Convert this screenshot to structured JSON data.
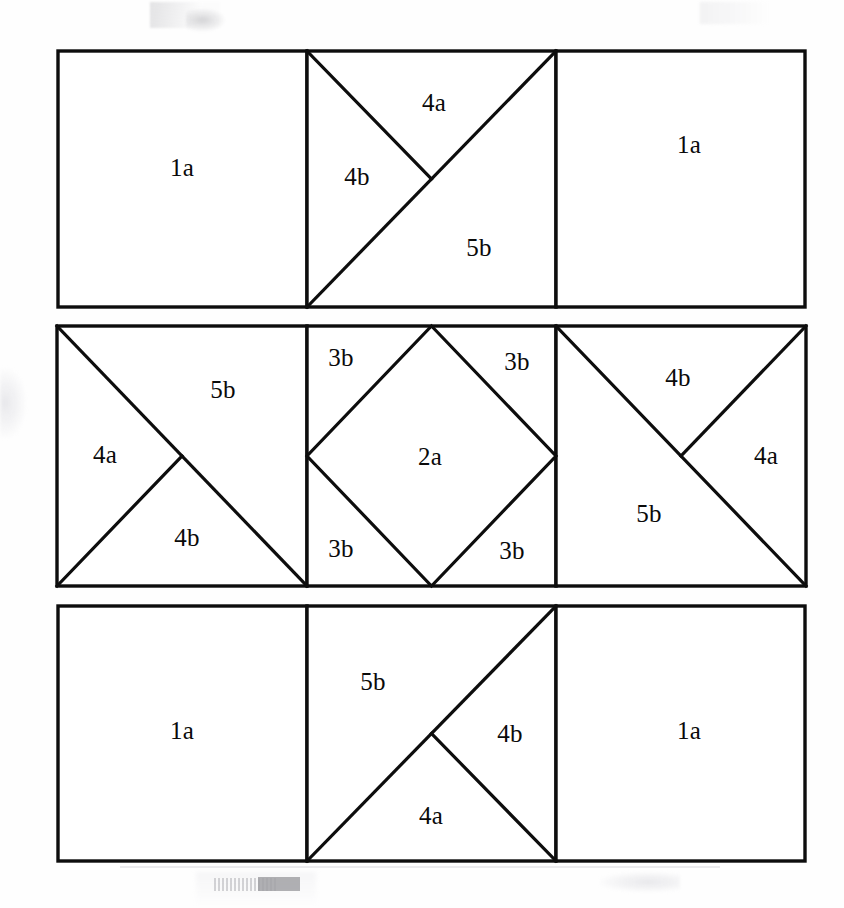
{
  "diagram": {
    "canvas": {
      "width": 844,
      "height": 908
    },
    "style": {
      "line_color": "#0d0d0d",
      "fill_color": "#ffffff",
      "background": "#fefefe",
      "outline_width": 3.4,
      "divider_width": 3.2
    },
    "rows": [
      {
        "name": "row-top",
        "bounds": {
          "x": 58,
          "y": 51,
          "width": 747,
          "height": 256
        },
        "dividers_x": [
          307,
          556
        ],
        "panels": [
          {
            "name": "panel-top-left",
            "bounds": {
              "x": 58,
              "y": 51,
              "width": 249,
              "height": 256
            },
            "pattern": "plain-square",
            "labels": [
              {
                "text": "1a",
                "x": 182,
                "y": 170
              }
            ],
            "cuts": []
          },
          {
            "name": "panel-top-center",
            "bounds": {
              "x": 307,
              "y": 51,
              "width": 249,
              "height": 256
            },
            "pattern": "diagonal-bl-tr-plus-tl-to-center",
            "labels": [
              {
                "text": "4a",
                "x": 434,
                "y": 105
              },
              {
                "text": "4b",
                "x": 357,
                "y": 179
              },
              {
                "text": "5b",
                "x": 479,
                "y": 250
              }
            ],
            "cuts": [
              {
                "from": "bottom-left",
                "to": "top-right"
              },
              {
                "from": "top-left",
                "to": "center"
              }
            ]
          },
          {
            "name": "panel-top-right",
            "bounds": {
              "x": 556,
              "y": 51,
              "width": 249,
              "height": 256
            },
            "pattern": "plain-square",
            "labels": [
              {
                "text": "1a",
                "x": 689,
                "y": 147
              }
            ],
            "cuts": []
          }
        ]
      },
      {
        "name": "row-middle",
        "bounds": {
          "x": 57,
          "y": 326,
          "width": 749,
          "height": 260
        },
        "dividers_x": [
          307,
          556
        ],
        "panels": [
          {
            "name": "panel-middle-left",
            "bounds": {
              "x": 57,
              "y": 326,
              "width": 250,
              "height": 260
            },
            "pattern": "diagonal-tl-br-plus-bl-to-center",
            "labels": [
              {
                "text": "5b",
                "x": 223,
                "y": 392
              },
              {
                "text": "4a",
                "x": 105,
                "y": 457
              },
              {
                "text": "4b",
                "x": 187,
                "y": 540
              }
            ],
            "cuts": [
              {
                "from": "top-left",
                "to": "bottom-right"
              },
              {
                "from": "bottom-left",
                "to": "center"
              }
            ]
          },
          {
            "name": "panel-middle-center",
            "bounds": {
              "x": 307,
              "y": 326,
              "width": 249,
              "height": 260
            },
            "pattern": "inscribed-diamond",
            "labels": [
              {
                "text": "3b",
                "x": 341,
                "y": 360
              },
              {
                "text": "3b",
                "x": 517,
                "y": 364
              },
              {
                "text": "2a",
                "x": 430,
                "y": 459
              },
              {
                "text": "3b",
                "x": 341,
                "y": 551
              },
              {
                "text": "3b",
                "x": 512,
                "y": 553
              }
            ],
            "cuts": [
              {
                "from": "midpoint-top",
                "to": "midpoint-right"
              },
              {
                "from": "midpoint-right",
                "to": "midpoint-bottom"
              },
              {
                "from": "midpoint-bottom",
                "to": "midpoint-left"
              },
              {
                "from": "midpoint-left",
                "to": "midpoint-top"
              }
            ]
          },
          {
            "name": "panel-middle-right",
            "bounds": {
              "x": 556,
              "y": 326,
              "width": 250,
              "height": 260
            },
            "pattern": "diagonal-tl-br-plus-tr-to-center",
            "labels": [
              {
                "text": "4b",
                "x": 678,
                "y": 380
              },
              {
                "text": "4a",
                "x": 766,
                "y": 458
              },
              {
                "text": "5b",
                "x": 649,
                "y": 516
              }
            ],
            "cuts": [
              {
                "from": "top-left",
                "to": "bottom-right"
              },
              {
                "from": "top-right",
                "to": "center"
              }
            ]
          }
        ]
      },
      {
        "name": "row-bottom",
        "bounds": {
          "x": 58,
          "y": 606,
          "width": 747,
          "height": 255
        },
        "dividers_x": [
          307,
          556
        ],
        "panels": [
          {
            "name": "panel-bottom-left",
            "bounds": {
              "x": 58,
              "y": 606,
              "width": 249,
              "height": 255
            },
            "pattern": "plain-square",
            "labels": [
              {
                "text": "1a",
                "x": 182,
                "y": 733
              }
            ],
            "cuts": []
          },
          {
            "name": "panel-bottom-center",
            "bounds": {
              "x": 307,
              "y": 606,
              "width": 249,
              "height": 255
            },
            "pattern": "diagonal-bl-tr-plus-br-to-center",
            "labels": [
              {
                "text": "5b",
                "x": 373,
                "y": 684
              },
              {
                "text": "4b",
                "x": 510,
                "y": 736
              },
              {
                "text": "4a",
                "x": 431,
                "y": 818
              }
            ],
            "cuts": [
              {
                "from": "bottom-left",
                "to": "top-right"
              },
              {
                "from": "bottom-right",
                "to": "center"
              }
            ]
          },
          {
            "name": "panel-bottom-right",
            "bounds": {
              "x": 556,
              "y": 606,
              "width": 249,
              "height": 255
            },
            "pattern": "plain-square",
            "labels": [
              {
                "text": "1a",
                "x": 689,
                "y": 733
              }
            ],
            "cuts": []
          }
        ]
      }
    ],
    "patch_codes": [
      "1a",
      "2a",
      "3b",
      "4a",
      "4b",
      "5b"
    ]
  }
}
